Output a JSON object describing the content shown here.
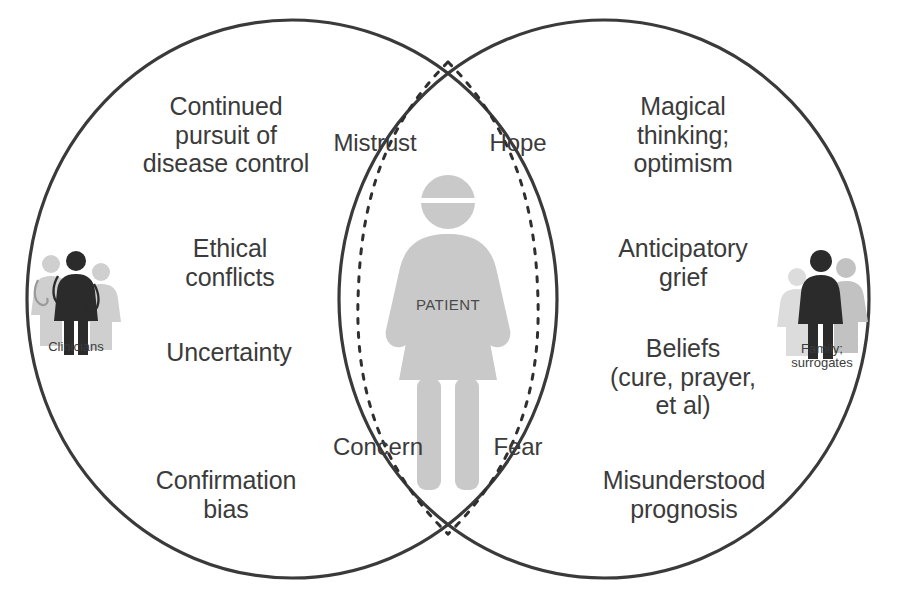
{
  "diagram": {
    "type": "venn",
    "stroke_color": "#3a3a3a",
    "text_color": "#3b3b3b",
    "background": "#ffffff",
    "circles": [
      {
        "id": "clinicians",
        "side": "left"
      },
      {
        "id": "family",
        "side": "right"
      }
    ]
  },
  "left_circle": {
    "actor": {
      "caption_line1": "Clinicians",
      "caption_line2": "",
      "icon": "clinicians-group-icon"
    },
    "items": [
      {
        "text": "Continued\npursuit of\ndisease control"
      },
      {
        "text": "Ethical\nconflicts"
      },
      {
        "text": "Uncertainty"
      },
      {
        "text": "Confirmation\nbias"
      }
    ]
  },
  "right_circle": {
    "actor": {
      "caption_line1": "Family;",
      "caption_line2": "surrogates",
      "icon": "family-group-icon"
    },
    "items": [
      {
        "text": "Magical\nthinking;\noptimism"
      },
      {
        "text": "Anticipatory\ngrief"
      },
      {
        "text": "Beliefs\n(cure, prayer,\net al)"
      },
      {
        "text": "Misunderstood\nprognosis"
      }
    ]
  },
  "intersection": {
    "center_figure": {
      "label": "PATIENT",
      "icon": "patient-person-icon"
    },
    "labels": [
      {
        "id": "mistrust",
        "text": "Mistrust",
        "position": "top-left"
      },
      {
        "id": "hope",
        "text": "Hope",
        "position": "top-right"
      },
      {
        "id": "concern",
        "text": "Concern",
        "position": "bottom-left"
      },
      {
        "id": "fear",
        "text": "Fear",
        "position": "bottom-right"
      }
    ]
  },
  "colors": {
    "outline": "#3a3a3a",
    "dashed_outline": "#2f2f2f",
    "patient_fill": "#c9c9c9",
    "figure_dark": "#2b2b2b",
    "figure_mid": "#b5b5b5",
    "figure_light": "#dcdcdc"
  }
}
